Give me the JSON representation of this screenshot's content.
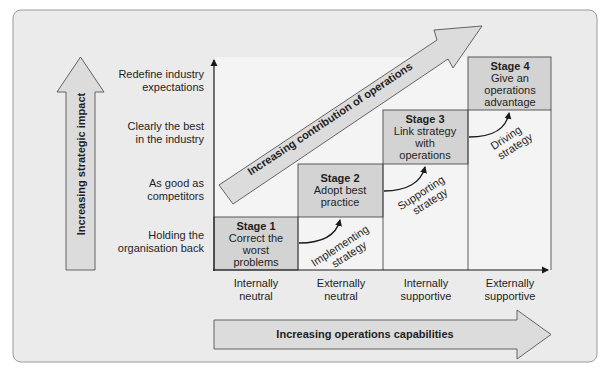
{
  "colors": {
    "frame_bg": "#ebebeb",
    "frame_border": "#9a9a9a",
    "plot_bg": "#f4f4f4",
    "stage_fill": "#d3d3d3",
    "arrow_fill": "#dcdcdc",
    "line": "#1a1a1a"
  },
  "y_axis": {
    "arrow_label": "Increasing strategic impact",
    "levels": [
      {
        "line1": "Redefine industry",
        "line2": "expectations"
      },
      {
        "line1": "Clearly the best",
        "line2": "in the industry"
      },
      {
        "line1": "As good as",
        "line2": "competitors"
      },
      {
        "line1": "Holding the",
        "line2": "organisation back"
      }
    ]
  },
  "x_axis": {
    "arrow_label": "Increasing operations capabilities",
    "columns": [
      {
        "line1": "Internally",
        "line2": "neutral"
      },
      {
        "line1": "Externally",
        "line2": "neutral"
      },
      {
        "line1": "Internally",
        "line2": "supportive"
      },
      {
        "line1": "Externally",
        "line2": "supportive"
      }
    ]
  },
  "diagonal_arrow": {
    "label": "Increasing contribution of operations"
  },
  "stages": [
    {
      "title": "Stage 1",
      "lines": [
        "Correct the",
        "worst",
        "problems"
      ]
    },
    {
      "title": "Stage 2",
      "lines": [
        "Adopt best",
        "practice"
      ]
    },
    {
      "title": "Stage 3",
      "lines": [
        "Link strategy",
        "with",
        "operations"
      ]
    },
    {
      "title": "Stage 4",
      "lines": [
        "Give an",
        "operations",
        "advantage"
      ]
    }
  ],
  "transitions": [
    {
      "line1": "Implementing",
      "line2": "strategy"
    },
    {
      "line1": "Supporting",
      "line2": "strategy"
    },
    {
      "line1": "Driving",
      "line2": "strategy"
    }
  ]
}
